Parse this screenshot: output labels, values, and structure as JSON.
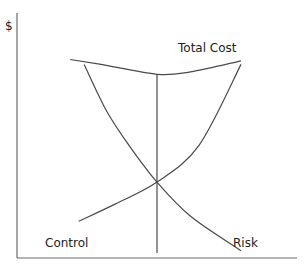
{
  "chart_data": {
    "type": "line",
    "title": "",
    "xlabel": "",
    "ylabel": "$",
    "xlim": [
      0,
      100
    ],
    "ylim": [
      0,
      100
    ],
    "grid": false,
    "series": [
      {
        "name": "Total Cost",
        "label": "Total Cost",
        "x": [
          19,
          30,
          50,
          62,
          80
        ],
        "y": [
          81,
          79,
          75,
          76,
          80.5
        ]
      },
      {
        "name": "Control",
        "label": "Control",
        "x": [
          24,
          32,
          40,
          50,
          62,
          80
        ],
        "y": [
          79,
          60,
          46,
          31,
          17,
          3
        ]
      },
      {
        "name": "Risk",
        "label": "Risk",
        "x": [
          22,
          35,
          50,
          65,
          80
        ],
        "y": [
          15,
          22,
          31,
          46,
          79
        ]
      }
    ],
    "reference_lines": [
      {
        "orientation": "vertical",
        "x": 50,
        "from_y": 2,
        "to_y": 75,
        "meaning": "optimal point (minimum total cost)"
      }
    ],
    "annotations": [
      {
        "text": "Total Cost"
      },
      {
        "text": "Control"
      },
      {
        "text": "Risk"
      }
    ]
  },
  "labels": {
    "y_axis": "$",
    "total_cost": "Total Cost",
    "control": "Control",
    "risk": "Risk"
  }
}
